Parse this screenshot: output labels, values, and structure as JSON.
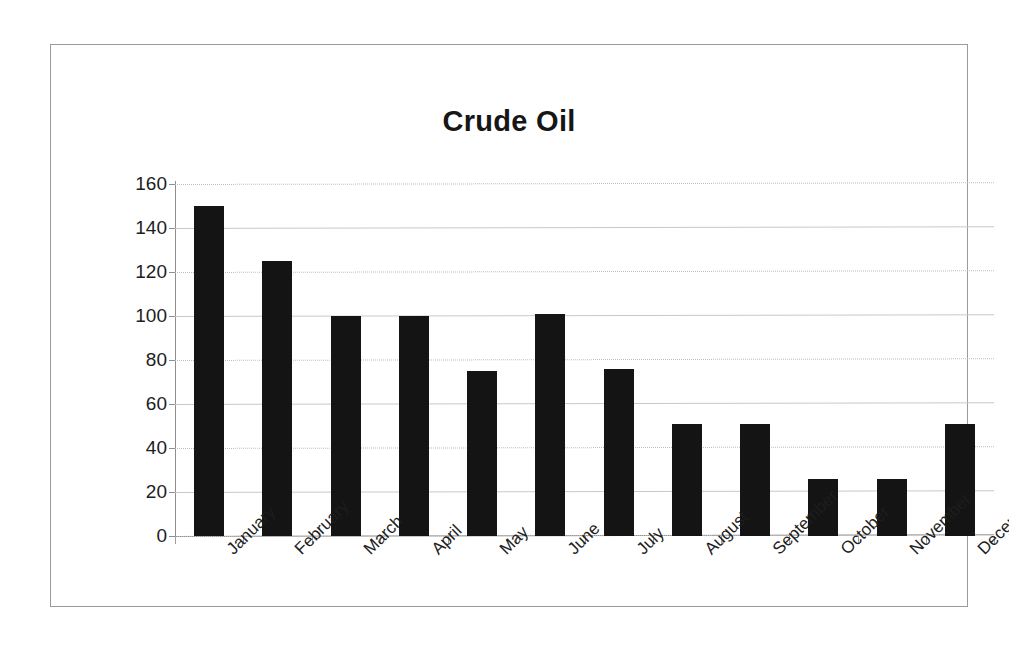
{
  "chart_data": {
    "type": "bar",
    "title": "Crude Oil",
    "xlabel": "",
    "ylabel": "",
    "categories": [
      "January",
      "February",
      "March",
      "April",
      "May",
      "June",
      "July",
      "August",
      "September",
      "October",
      "November",
      "December"
    ],
    "values": [
      150,
      125,
      100,
      100,
      75,
      101,
      76,
      51,
      51,
      26,
      26,
      51
    ],
    "ylim": [
      0,
      160
    ],
    "ytick_labels": [
      "160",
      "140",
      "120",
      "100",
      "80",
      "60",
      "40",
      "20",
      "0"
    ],
    "ytick_values": [
      160,
      140,
      120,
      100,
      80,
      60,
      40,
      20,
      0
    ],
    "grid": true,
    "legend": "none",
    "bar_color": "#141414",
    "gridline_color": "#c9c9c9",
    "axis_color": "#8e8e8e",
    "frame_color": "#9a9a9a",
    "background": "#ffffff"
  }
}
